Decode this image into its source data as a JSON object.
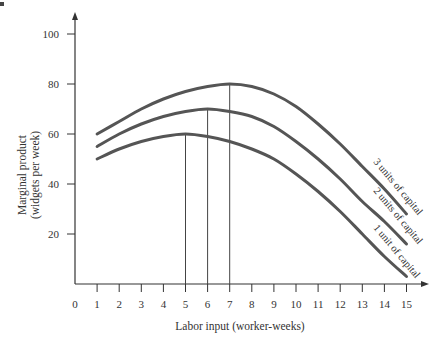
{
  "chart_data": {
    "type": "line",
    "title": "",
    "xlabel": "Labor input (worker-weeks)",
    "ylabel": "Marginal product (widgets per week)",
    "ylabel_lines": [
      "Marginal product",
      "(widgets per week)"
    ],
    "xlim": [
      0,
      15
    ],
    "ylim": [
      0,
      100
    ],
    "x_ticks": [
      0,
      1,
      2,
      3,
      4,
      5,
      6,
      7,
      8,
      9,
      10,
      11,
      12,
      13,
      14,
      15
    ],
    "y_ticks": [
      20,
      40,
      60,
      80,
      100
    ],
    "grid": false,
    "legend": "inline curve labels",
    "x": [
      1,
      2,
      3,
      4,
      5,
      6,
      7,
      8,
      9,
      10,
      11,
      12,
      13,
      14,
      15
    ],
    "series": [
      {
        "name": "1 unit of capital",
        "values": [
          50,
          54,
          57,
          59,
          60,
          59,
          57,
          54,
          50,
          44,
          37,
          29,
          20,
          11,
          3
        ]
      },
      {
        "name": "2 units of capital",
        "values": [
          55,
          60,
          64,
          67,
          69,
          70,
          69,
          67,
          63,
          57,
          50,
          42,
          33,
          25,
          16
        ]
      },
      {
        "name": "3 units of capital",
        "values": [
          60,
          65,
          70,
          74,
          77,
          79,
          80,
          79,
          76,
          71,
          64,
          56,
          47,
          38,
          28
        ]
      }
    ],
    "annotations": [
      {
        "type": "vertical-line",
        "x": 5,
        "to_y": 60,
        "note": "peak of 1 unit of capital"
      },
      {
        "type": "vertical-line",
        "x": 6,
        "to_y": 70,
        "note": "peak of 2 units of capital"
      },
      {
        "type": "vertical-line",
        "x": 7,
        "to_y": 80,
        "note": "peak of 3 units of capital"
      }
    ]
  },
  "labels": {
    "xlabel": "Labor input (worker-weeks)",
    "ylabel_line1": "Marginal product",
    "ylabel_line2": "(widgets per week)",
    "curve1": "1 unit of capital",
    "curve2": "2 units of capital",
    "curve3": "3 units of capital"
  },
  "colors": {
    "curve": "#555555",
    "axis": "#333333",
    "vline": "#444444"
  }
}
